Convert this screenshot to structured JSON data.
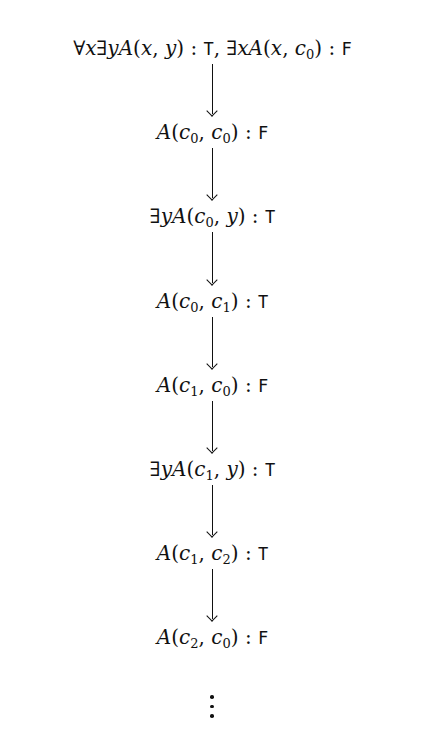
{
  "diagram": {
    "type": "derivation-chain",
    "nodes": [
      {
        "html": "∀<i>x</i>∃<i>yA</i>(<i>x</i>, <i>y</i>) : ",
        "value": "T",
        "extra_html": ", ∃<i>xA</i>(<i>x</i>, <i>c</i><sub>0</sub>) : ",
        "extra_value": "F",
        "text": "∀x∃yA(x,y) : T, ∃xA(x,c0) : F"
      },
      {
        "html": "<i>A</i>(<i>c</i><sub>0</sub>, <i>c</i><sub>0</sub>) : ",
        "value": "F",
        "text": "A(c0,c0) : F"
      },
      {
        "html": "∃<i>yA</i>(<i>c</i><sub>0</sub>, <i>y</i>) : ",
        "value": "T",
        "text": "∃yA(c0,y) : T"
      },
      {
        "html": "<i>A</i>(<i>c</i><sub>0</sub>, <i>c</i><sub>1</sub>) : ",
        "value": "T",
        "text": "A(c0,c1) : T"
      },
      {
        "html": "<i>A</i>(<i>c</i><sub>1</sub>, <i>c</i><sub>0</sub>) : ",
        "value": "F",
        "text": "A(c1,c0) : F"
      },
      {
        "html": "∃<i>yA</i>(<i>c</i><sub>1</sub>, <i>y</i>) : ",
        "value": "T",
        "text": "∃yA(c1,y) : T"
      },
      {
        "html": "<i>A</i>(<i>c</i><sub>1</sub>, <i>c</i><sub>2</sub>) : ",
        "value": "T",
        "text": "A(c1,c2) : T"
      },
      {
        "html": "<i>A</i>(<i>c</i><sub>2</sub>, <i>c</i><sub>0</sub>) : ",
        "value": "F",
        "text": "A(c2,c0) : F"
      }
    ],
    "edges": [
      [
        0,
        1
      ],
      [
        1,
        2
      ],
      [
        2,
        3
      ],
      [
        3,
        4
      ],
      [
        4,
        5
      ],
      [
        5,
        6
      ],
      [
        6,
        7
      ]
    ],
    "continuation": "⋮",
    "arrow_icon": "down-arrow"
  }
}
